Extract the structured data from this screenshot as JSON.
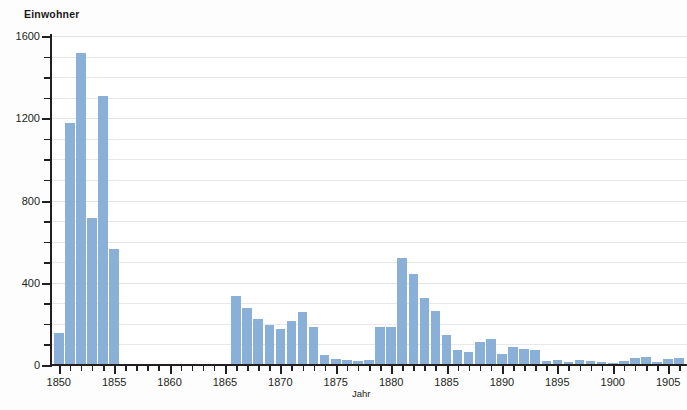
{
  "chart_data": {
    "type": "bar",
    "title": "",
    "subtitle": "",
    "xlabel": "Jahr",
    "ylabel": "Einwohner",
    "ylim": [
      0,
      1600
    ],
    "xlim": [
      1849.3,
      1906.7
    ],
    "grid": true,
    "legend": null,
    "y_ticks_major": [
      0,
      400,
      800,
      1200,
      1600
    ],
    "y_ticks_minor": [
      100,
      200,
      300,
      500,
      600,
      700,
      900,
      1000,
      1100,
      1300,
      1400,
      1500
    ],
    "x_ticks_major": [
      1850,
      1855,
      1860,
      1865,
      1870,
      1875,
      1880,
      1885,
      1890,
      1895,
      1900,
      1905
    ],
    "x_tick_labels": [
      "1850",
      "1855",
      "1860",
      "1865",
      "1870",
      "1875",
      "1880",
      "1885",
      "1890",
      "1895",
      "1900",
      "1905"
    ],
    "x_minor_tick_step": 1,
    "bar_color": "#8bb0d8",
    "axis_color": "#231f20",
    "grid_color": "#e8e8ea",
    "background_color": "#ffffff",
    "categories": [
      1850,
      1851,
      1852,
      1853,
      1854,
      1855,
      1866,
      1867,
      1868,
      1869,
      1870,
      1871,
      1872,
      1873,
      1874,
      1875,
      1876,
      1877,
      1878,
      1879,
      1880,
      1881,
      1882,
      1883,
      1884,
      1885,
      1886,
      1887,
      1888,
      1889,
      1890,
      1891,
      1892,
      1893,
      1894,
      1895,
      1896,
      1897,
      1898,
      1899,
      1900,
      1901,
      1902,
      1903,
      1904,
      1905,
      1906
    ],
    "values": [
      155,
      1175,
      1515,
      715,
      1310,
      565,
      335,
      275,
      225,
      195,
      175,
      215,
      260,
      185,
      50,
      30,
      25,
      20,
      25,
      185,
      185,
      520,
      445,
      325,
      265,
      145,
      75,
      65,
      110,
      125,
      55,
      90,
      80,
      75,
      20,
      25,
      15,
      25,
      20,
      15,
      10,
      20,
      35,
      40,
      15,
      30,
      35
    ]
  }
}
